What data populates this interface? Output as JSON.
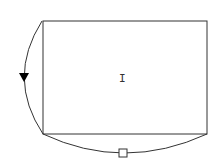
{
  "diagram": {
    "node_label": "I",
    "colors": {
      "stroke": "#333333",
      "background": "#ffffff",
      "arrow_fill": "#000000"
    },
    "shapes": {
      "rectangle": "main-rectangle",
      "left_edge": "curved-edge-with-arrow",
      "bottom_edge": "curved-edge-with-square-marker"
    }
  }
}
